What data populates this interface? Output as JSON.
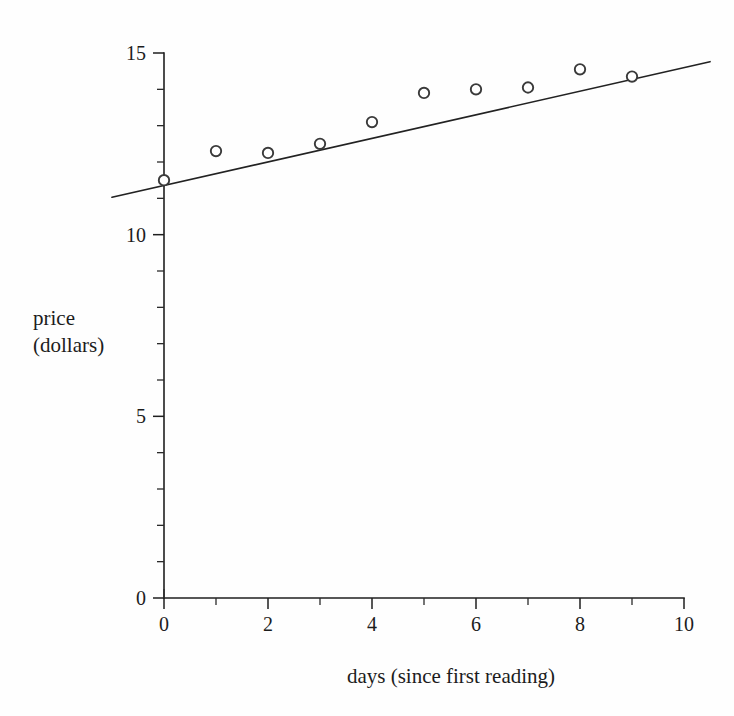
{
  "chart_data": {
    "type": "scatter",
    "title": "",
    "subtitle": "",
    "xlabel": "days (since first reading)",
    "ylabel": "price (dollars)",
    "ylabel_lines": [
      "price",
      "(dollars)"
    ],
    "xlim": [
      0,
      10
    ],
    "ylim": [
      0,
      15
    ],
    "x_major_ticks": [
      0,
      2,
      4,
      6,
      8,
      10
    ],
    "x_major_tick_labels": [
      "0",
      "2",
      "4",
      "6",
      "8",
      "10"
    ],
    "x_minor_ticks": [
      1,
      3,
      5,
      7,
      9
    ],
    "y_major_ticks": [
      0,
      5,
      10,
      15
    ],
    "y_major_tick_labels": [
      "0",
      "5",
      "10",
      "15"
    ],
    "y_minor_ticks": [
      1,
      2,
      3,
      4,
      6,
      7,
      8,
      9,
      11,
      12,
      13,
      14
    ],
    "grid": false,
    "legend": false,
    "legend_position": "none",
    "marker": "open-circle",
    "marker_color": "#3a3a3a",
    "marker_fill": "#ffffff",
    "line_color": "#222222",
    "axis_color": "#1f1f1f",
    "background_color": "#fefefe",
    "x": [
      0,
      1,
      2,
      3,
      4,
      5,
      6,
      7,
      8,
      9
    ],
    "series": [
      {
        "name": "price readings",
        "kind": "scatter",
        "values": [
          11.5,
          12.3,
          12.25,
          12.5,
          13.1,
          13.9,
          14.0,
          14.05,
          14.55,
          14.35
        ]
      },
      {
        "name": "least-squares trend line",
        "kind": "line",
        "slope": 0.325,
        "intercept": 11.35,
        "x_start": -1.0,
        "x_end": 10.5,
        "y_start": 11.03,
        "y_end": 14.76
      }
    ],
    "annotations": []
  }
}
